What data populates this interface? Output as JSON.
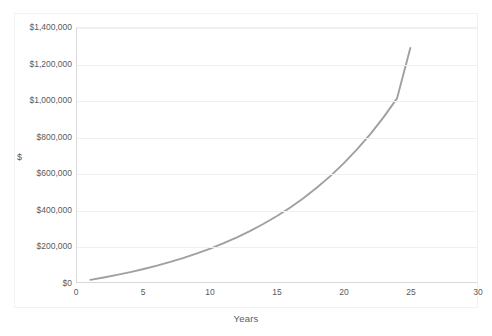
{
  "chart_data": {
    "type": "line",
    "title": "",
    "xlabel": "Years",
    "ylabel": "$",
    "xlim": [
      0,
      30
    ],
    "ylim": [
      0,
      1400000
    ],
    "grid": true,
    "legend": null,
    "line_color": "#a0a0a0",
    "xticks": [
      "0",
      "5",
      "10",
      "15",
      "20",
      "25",
      "30"
    ],
    "xtick_values": [
      0,
      5,
      10,
      15,
      20,
      25,
      30
    ],
    "yticks": [
      "$0",
      "$200,000",
      "$400,000",
      "$600,000",
      "$800,000",
      "$1,000,000",
      "$1,200,000",
      "$1,400,000"
    ],
    "ytick_values": [
      0,
      200000,
      400000,
      600000,
      800000,
      1000000,
      1200000,
      1400000
    ],
    "series": [
      {
        "name": "Balance",
        "x": [
          1,
          2,
          3,
          4,
          5,
          6,
          7,
          8,
          9,
          10,
          11,
          12,
          13,
          14,
          15,
          16,
          17,
          18,
          19,
          20,
          21,
          22,
          23,
          24,
          25
        ],
        "values": [
          12000,
          25000,
          39000,
          54500,
          71500,
          90000,
          110500,
          133000,
          157500,
          184500,
          214000,
          246500,
          282000,
          321000,
          364000,
          411000,
          463000,
          520500,
          583500,
          653500,
          730500,
          815500,
          909000,
          1012000,
          1290000
        ]
      }
    ]
  }
}
